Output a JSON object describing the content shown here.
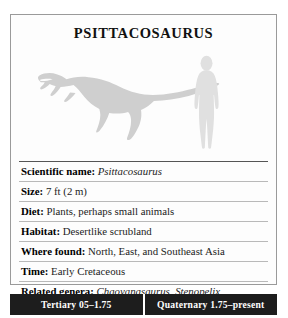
{
  "card": {
    "title": "PSITTACOSAURUS",
    "illustration": {
      "dinosaur_name": "dinosaur-silhouette",
      "human_name": "human-scale-silhouette",
      "silhouette_color": "#cfcfcf",
      "human_color": "#e0e0e0"
    },
    "facts": [
      {
        "label": "Scientific name:",
        "value": "Psittacosaurus",
        "italic": true
      },
      {
        "label": "Size:",
        "value": "7 ft (2 m)",
        "italic": false
      },
      {
        "label": "Diet:",
        "value": "Plants, perhaps small animals",
        "italic": false
      },
      {
        "label": "Habitat:",
        "value": "Desertlike scrubland",
        "italic": false
      },
      {
        "label": "Where found:",
        "value": "North, East, and Southeast Asia",
        "italic": false
      },
      {
        "label": "Time:",
        "value": "Early Cretaceous",
        "italic": false
      },
      {
        "label": "Related genera:",
        "value": "Chaoyangsaurus, Stenopelix",
        "italic": true
      }
    ]
  },
  "timeline": {
    "background_color": "#1d1d1d",
    "text_color": "#ffffff",
    "segments": [
      {
        "label": "Tertiary 05–1.75"
      },
      {
        "label": "Quaternary 1.75–present"
      }
    ]
  }
}
